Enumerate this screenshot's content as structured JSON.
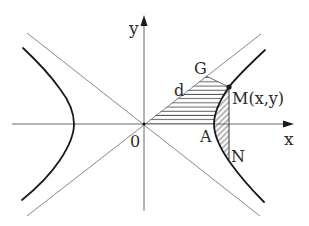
{
  "diagram": {
    "type": "hyperbola-with-asymptotes",
    "axes": {
      "x_label": "x",
      "y_label": "y",
      "origin_label": "0"
    },
    "points": {
      "G": "G",
      "M": "M(x,y)",
      "A": "A",
      "N": "N"
    },
    "segment_labels": {
      "d": "d"
    },
    "colors": {
      "curve": "#1a1a1a",
      "asymptote": "#8a8a8a",
      "axis": "#6a6a6a",
      "hatch": "#4a4a4a",
      "text": "#2a2a2a"
    }
  }
}
